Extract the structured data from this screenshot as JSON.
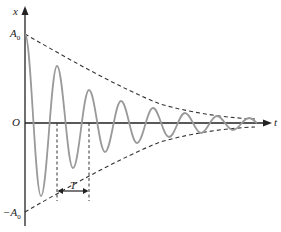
{
  "diagram": {
    "type": "damped-oscillation",
    "labels": {
      "y_axis": "x",
      "x_axis": "t",
      "origin": "O",
      "amplitude_pos": "A",
      "amplitude_pos_sub": "0",
      "amplitude_neg": "−A",
      "amplitude_neg_sub": "0",
      "period": "T"
    },
    "colors": {
      "axes": "#222222",
      "wave": "#9a9a9a",
      "envelope": "#333333",
      "guides": "#333333"
    }
  }
}
